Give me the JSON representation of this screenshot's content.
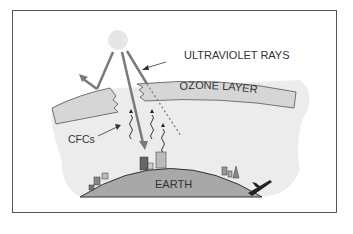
{
  "diagram": {
    "labels": {
      "ultraviolet": "ULTRAVIOLET RAYS",
      "ozone": "OZONE LAYER",
      "cfcs": "CFCs",
      "earth": "EARTH"
    },
    "colors": {
      "frame": "#555555",
      "atmosphere": "#ececec",
      "ozone_band": "#d6d6d6",
      "earth": "#a8a8a8",
      "rays": "#7a7a7a",
      "sun": "#e6e6e6",
      "text": "#333333"
    }
  }
}
